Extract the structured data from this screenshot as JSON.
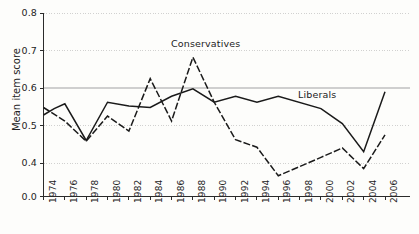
{
  "chart_data": {
    "type": "line",
    "title": "",
    "xlabel": "",
    "ylabel": "Mean item score",
    "grid": true,
    "grid_axis": "y",
    "legend_position": "inline-annotations",
    "xlim": [
      1974,
      2006
    ],
    "ylim": [
      0.4,
      0.8
    ],
    "y_axis_has_break_to_zero": true,
    "ytick_labels": [
      "0.0",
      "0.4",
      "0.5",
      "0.6",
      "0.7",
      "0.8"
    ],
    "ytick_values": [
      0.0,
      0.4,
      0.5,
      0.6,
      0.7,
      0.8
    ],
    "xtick_labels": [
      "1974",
      "1976",
      "1978",
      "1980",
      "1982",
      "1984",
      "1986",
      "1988",
      "1990",
      "1992",
      "1994",
      "1996",
      "1998",
      "2000",
      "2002",
      "2004",
      "2006"
    ],
    "xtick_values": [
      1974,
      1976,
      1978,
      1980,
      1982,
      1984,
      1986,
      1988,
      1990,
      1992,
      1994,
      1996,
      1998,
      2000,
      2002,
      2004,
      2006
    ],
    "series": [
      {
        "name": "Liberals",
        "style": "solid",
        "color": "#1a1a1a",
        "label_position": {
          "x": 298,
          "y": 89
        },
        "x": [
          1974,
          1975,
          1976,
          1978,
          1980,
          1982,
          1984,
          1986,
          1988,
          1990,
          1992,
          1994,
          1996,
          2000,
          2002,
          2004,
          2006
        ],
        "values": [
          0.528,
          0.545,
          0.558,
          0.46,
          0.562,
          0.552,
          0.548,
          0.578,
          0.598,
          0.562,
          0.578,
          0.562,
          0.578,
          0.545,
          0.505,
          0.43,
          0.59
        ]
      },
      {
        "name": "Conservatives",
        "style": "dashed",
        "color": "#1a1a1a",
        "label_position": {
          "x": 171,
          "y": 38
        },
        "x": [
          1974,
          1976,
          1978,
          1980,
          1982,
          1984,
          1986,
          1988,
          1990,
          1992,
          1994,
          1996,
          2000,
          2002,
          2004,
          2006
        ],
        "values": [
          0.548,
          0.512,
          0.458,
          0.525,
          0.485,
          0.625,
          0.512,
          0.682,
          0.562,
          0.462,
          0.442,
          0.366,
          0.415,
          0.44,
          0.385,
          0.475
        ]
      }
    ]
  },
  "axes": {
    "ylabel": "Mean item score",
    "yticks": [
      {
        "label": "0.0"
      },
      {
        "label": "0.4"
      },
      {
        "label": "0.5"
      },
      {
        "label": "0.6"
      },
      {
        "label": "0.7"
      },
      {
        "label": "0.8"
      }
    ],
    "xticks": [
      {
        "label": "1974"
      },
      {
        "label": "1976"
      },
      {
        "label": "1978"
      },
      {
        "label": "1980"
      },
      {
        "label": "1982"
      },
      {
        "label": "1984"
      },
      {
        "label": "1986"
      },
      {
        "label": "1988"
      },
      {
        "label": "1990"
      },
      {
        "label": "1992"
      },
      {
        "label": "1994"
      },
      {
        "label": "1996"
      },
      {
        "label": "1998"
      },
      {
        "label": "2000"
      },
      {
        "label": "2002"
      },
      {
        "label": "2004"
      },
      {
        "label": "2006"
      }
    ]
  },
  "annotations": {
    "conservatives": "Conservatives",
    "liberals": "Liberals"
  }
}
